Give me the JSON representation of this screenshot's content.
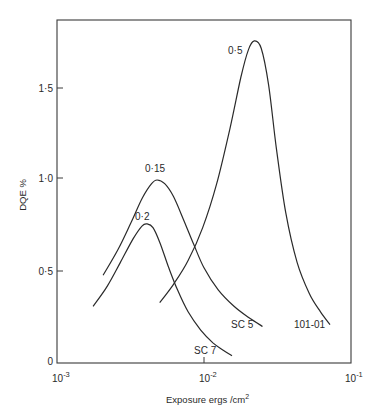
{
  "chart_data": {
    "type": "line",
    "title": "",
    "xlabel": "Exposure ergs/cm",
    "xlabel_sup": "2",
    "ylabel": "DQE %",
    "xscale": "log",
    "xlim": [
      0.001,
      0.1
    ],
    "ylim": [
      0,
      1.85
    ],
    "grid": false,
    "legend": "none (curves labeled inline)",
    "x_ticks": [
      {
        "value": 0.001,
        "base": "10",
        "exp": "-3"
      },
      {
        "value": 0.01,
        "base": "10",
        "exp": "-2"
      },
      {
        "value": 0.1,
        "base": "10",
        "exp": "-1"
      }
    ],
    "y_ticks": [
      {
        "value": 0,
        "label": "0"
      },
      {
        "value": 0.5,
        "label": "0·5"
      },
      {
        "value": 1.0,
        "label": "1·0"
      },
      {
        "value": 1.5,
        "label": "1·5"
      }
    ],
    "series": [
      {
        "name": "SC 5",
        "peak_label": "0·15",
        "x": [
          0.00206,
          0.0026,
          0.0032,
          0.0038,
          0.0044,
          0.0048,
          0.0054,
          0.0062,
          0.0072,
          0.0085,
          0.01,
          0.0125,
          0.016,
          0.02,
          0.025
        ],
        "y": [
          0.48,
          0.62,
          0.77,
          0.9,
          0.98,
          1.0,
          0.98,
          0.91,
          0.79,
          0.65,
          0.52,
          0.4,
          0.31,
          0.25,
          0.2
        ]
      },
      {
        "name": "SC 7",
        "peak_label": "0·2",
        "x": [
          0.00176,
          0.0022,
          0.0027,
          0.0033,
          0.0038,
          0.0041,
          0.0045,
          0.005,
          0.0057,
          0.0066,
          0.0078,
          0.0095,
          0.0115,
          0.0135,
          0.0155
        ],
        "y": [
          0.31,
          0.42,
          0.55,
          0.68,
          0.75,
          0.76,
          0.74,
          0.66,
          0.53,
          0.4,
          0.28,
          0.18,
          0.11,
          0.07,
          0.04
        ]
      },
      {
        "name": "101-01",
        "peak_label": "0·5",
        "x": [
          0.005,
          0.0062,
          0.0078,
          0.0098,
          0.0122,
          0.015,
          0.0178,
          0.02,
          0.022,
          0.0245,
          0.0275,
          0.031,
          0.036,
          0.043,
          0.052,
          0.062,
          0.072
        ],
        "y": [
          0.33,
          0.43,
          0.56,
          0.74,
          0.98,
          1.28,
          1.56,
          1.71,
          1.76,
          1.72,
          1.52,
          1.18,
          0.82,
          0.55,
          0.38,
          0.28,
          0.21
        ]
      }
    ]
  },
  "labels": {
    "y_axis_title": "DQE %",
    "x_axis_title": "Exposure ergs /cm",
    "x_axis_title_sup": "2",
    "curve_0_15": "0·15",
    "curve_0_2": "0·2",
    "curve_0_5": "0·5",
    "sc5": "SC 5",
    "sc7": "SC 7",
    "c10101": "101-01",
    "ytick_0": "0",
    "ytick_05": "0·5",
    "ytick_10": "1·0",
    "ytick_15": "1·5",
    "xtick_base": "10",
    "xtick_m3": "-3",
    "xtick_m2": "-2",
    "xtick_m1": "-1"
  },
  "colors": {
    "ink": "#2a2a2a",
    "background": "#ffffff"
  }
}
